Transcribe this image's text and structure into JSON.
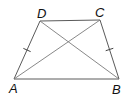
{
  "figure": {
    "type": "isosceles-trapezoid",
    "width": 129,
    "height": 99,
    "stroke_color": "#5a5a5a",
    "label_color": "#111111",
    "vertices": {
      "A": {
        "label": "A",
        "x": 14,
        "y": 79,
        "label_x": 9,
        "label_y": 93
      },
      "B": {
        "label": "B",
        "x": 119,
        "y": 79,
        "label_x": 112,
        "label_y": 94
      },
      "C": {
        "label": "C",
        "x": 100,
        "y": 20,
        "label_x": 95,
        "label_y": 17
      },
      "D": {
        "label": "D",
        "x": 40,
        "y": 21,
        "label_x": 37,
        "label_y": 18
      }
    },
    "sides": [
      "AB",
      "BC",
      "CD",
      "DA"
    ],
    "diagonals": [
      "AC",
      "BD"
    ],
    "congruence_marks": [
      {
        "side": "AD",
        "ticks": 1
      },
      {
        "side": "BC",
        "ticks": 1
      }
    ]
  }
}
